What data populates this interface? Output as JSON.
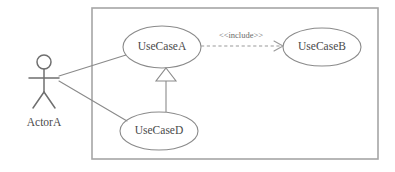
{
  "diagram": {
    "kind": "uml-use-case-diagram",
    "background_color": "#ffffff",
    "line_color": "#8a8a8a",
    "boundary_color": "#a6a6a6",
    "text_color": "#4a4a4a"
  },
  "system_boundary": {
    "label": "",
    "x": 92,
    "y": 8,
    "width": 286,
    "height": 151
  },
  "actors": [
    {
      "id": "actor-a",
      "label": "ActorA",
      "cx": 44,
      "label_y": 123
    }
  ],
  "use_cases": [
    {
      "id": "use-case-a",
      "label": "UseCaseA",
      "cx": 162,
      "cy": 47,
      "rx": 39,
      "ry": 21
    },
    {
      "id": "use-case-b",
      "label": "UseCaseB",
      "cx": 322,
      "cy": 47,
      "rx": 39,
      "ry": 19
    },
    {
      "id": "use-case-d",
      "label": "UseCaseD",
      "cx": 159,
      "cy": 131,
      "rx": 39,
      "ry": 19
    }
  ],
  "relationships": [
    {
      "id": "assoc-actor-a-usecase-a",
      "type": "association",
      "from": "actor-a",
      "to": "use-case-a",
      "label": ""
    },
    {
      "id": "assoc-actor-a-usecase-d",
      "type": "association",
      "from": "actor-a",
      "to": "use-case-d",
      "label": ""
    },
    {
      "id": "include-a-to-b",
      "type": "include",
      "from": "use-case-a",
      "to": "use-case-b",
      "label": "<<include>>",
      "label_x": 241,
      "label_y": 37,
      "style": "dashed"
    },
    {
      "id": "generalization-d-to-a",
      "type": "generalization",
      "from": "use-case-d",
      "to": "use-case-a",
      "label": ""
    }
  ]
}
